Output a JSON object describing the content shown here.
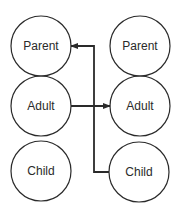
{
  "diagram": {
    "left_column": {
      "nodes": [
        {
          "label": "Parent"
        },
        {
          "label": "Adult"
        },
        {
          "label": "Child"
        }
      ]
    },
    "right_column": {
      "nodes": [
        {
          "label": "Parent"
        },
        {
          "label": "Adult"
        },
        {
          "label": "Child"
        }
      ]
    },
    "connections": [
      {
        "from": "right Child",
        "to": "left Parent",
        "arrow": "into left Parent"
      },
      {
        "from": "left Adult",
        "to": "right Adult",
        "arrow": "into right Adult"
      }
    ],
    "colors": {
      "stroke": "#2a2a2a",
      "text": "#2a2a2a",
      "background": "#ffffff"
    }
  }
}
